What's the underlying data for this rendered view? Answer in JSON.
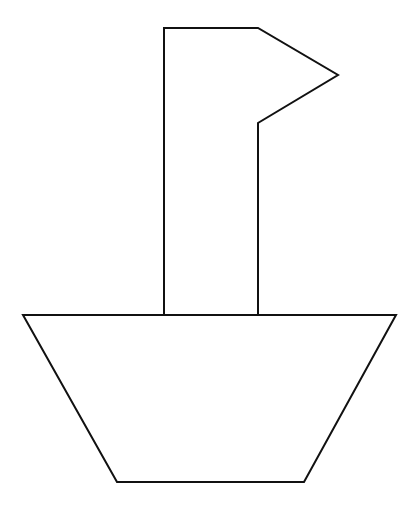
{
  "figure": {
    "width": 418,
    "height": 508,
    "background": "#ffffff",
    "stroke_color": "#111111",
    "stroke_width": 2,
    "shapes": [
      {
        "name": "flag-mast",
        "points": "164,315 164,28 258,28 338,75 258,123 258,315"
      },
      {
        "name": "hull",
        "points": "23,315 396,315 304,482 117,482"
      }
    ]
  }
}
